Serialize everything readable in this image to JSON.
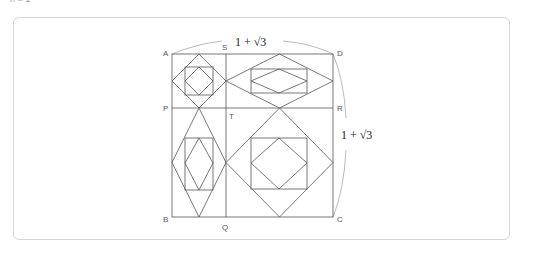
{
  "caption": "n = 1",
  "figure": {
    "points": {
      "A": "A",
      "S": "S",
      "D": "D",
      "P": "P",
      "T": "T",
      "R": "R",
      "B": "B",
      "Q": "Q",
      "C": "C"
    },
    "top_length_label": "1 + √3",
    "side_length_label": "1 + √3",
    "colors": {
      "line": "#555555",
      "arc": "#aaaaaa"
    }
  }
}
